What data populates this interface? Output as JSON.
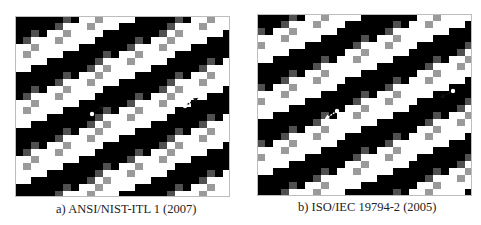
{
  "figure": {
    "panels": [
      {
        "id": "a",
        "caption": "a)  ANSI/NIST-ITL 1 (2007)",
        "markers": [
          {
            "x": 77,
            "y": 98,
            "dx": 12,
            "dy": -8,
            "style": "white-dot-dark-arrow-up-right"
          },
          {
            "x": 170,
            "y": 90,
            "dx": 13,
            "dy": -8,
            "style": "white-dot-dark-arrow-up-right"
          }
        ]
      },
      {
        "id": "b",
        "caption": "b)  ISO/IEC 19794-2 (2005)",
        "markers": [
          {
            "x": 80,
            "y": 97,
            "dx": -12,
            "dy": 8,
            "style": "white-dot-white-arrow-down-left"
          },
          {
            "x": 196,
            "y": 77,
            "dx": -13,
            "dy": 7,
            "style": "ring-dark-arrow-down-left"
          }
        ]
      }
    ],
    "colors": {
      "ridge": "#000000",
      "valley": "#ffffff",
      "grey_light": "#9a9a9a",
      "grey_dark": "#505050",
      "border": "#bdbdbd"
    }
  }
}
